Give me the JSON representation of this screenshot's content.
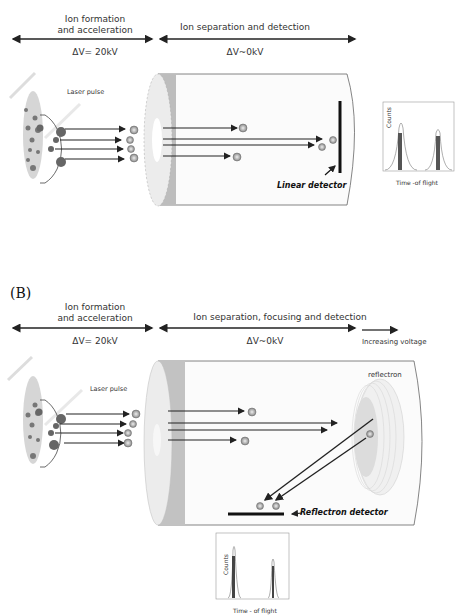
{
  "panel_a": {
    "label": "",
    "stage1": {
      "title_line1": "Ion formation",
      "title_line2": "and acceleration",
      "voltage": "ΔV= 20kV"
    },
    "stage2": {
      "title": "Ion separation and detection",
      "voltage": "ΔV~0kV"
    },
    "laser_label": "Laser pulse",
    "detector_label": "Linear detector",
    "spectrum": {
      "ylabel": "Counts",
      "xlabel": "Time -of flight"
    }
  },
  "panel_b": {
    "label": "(B)",
    "stage1": {
      "title_line1": "Ion formation",
      "title_line2": "and acceleration",
      "voltage": "ΔV= 20kV"
    },
    "stage2": {
      "title": "Ion separation, focusing and detection",
      "voltage": "ΔV~0kV"
    },
    "stage3": {
      "label": "Increasing  voltage"
    },
    "laser_label": "Laser pulse",
    "reflectron_label": "reflectron",
    "detector_label": "Reflectron  detector",
    "spectrum": {
      "ylabel": "Counts",
      "xlabel": "Time - of flight"
    }
  },
  "colors": {
    "ring_dark": "#bdbdbd",
    "ring_light": "#e6e6e6",
    "ion": "#8a8a8a",
    "arrow": "#222222",
    "sample_plate": "#d8d8d8"
  }
}
